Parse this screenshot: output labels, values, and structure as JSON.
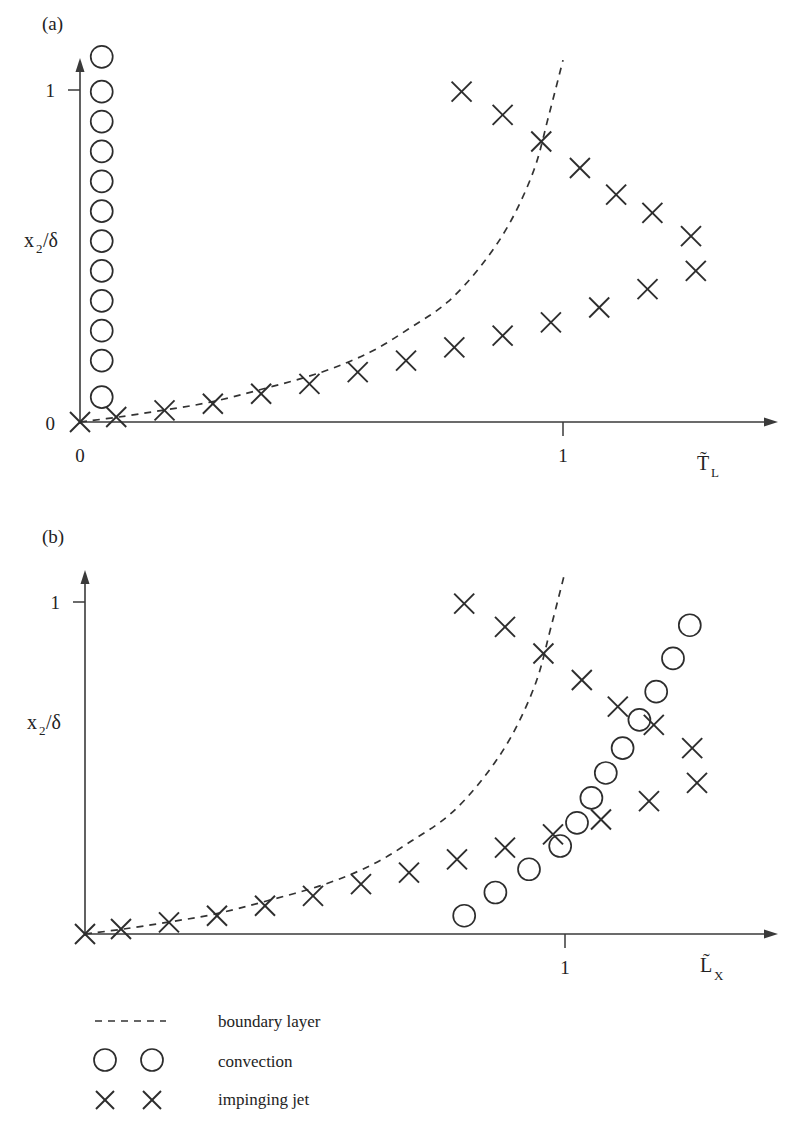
{
  "figure": {
    "background": "#ffffff",
    "ink_color": "#2d2d2d",
    "panels": [
      {
        "tag": "(a)",
        "tag_pos": [
          42,
          25
        ],
        "y_axis_label": "x_2/δ",
        "y_axis_label_parts": {
          "base": "x",
          "sub": "2",
          "tail": "/δ"
        },
        "x_axis_label_parts": {
          "base": "T̃",
          "sub": "L"
        },
        "x_axis_label": "T̃_L",
        "y_ticks": [
          {
            "value": "1",
            "px": 90
          },
          {
            "value": "0",
            "px": 422
          }
        ],
        "x_ticks": [
          {
            "value": "0",
            "px": 80
          },
          {
            "value": "1",
            "px": 563
          }
        ],
        "origin_px": [
          80,
          422
        ],
        "x_axis_end_px": 778,
        "y_axis_top_px": 60
      },
      {
        "tag": "(b)",
        "tag_pos": [
          42,
          538
        ],
        "y_axis_label": "x_2/δ",
        "y_axis_label_parts": {
          "base": "x",
          "sub": "2",
          "tail": "/δ"
        },
        "x_axis_label_parts": {
          "base": "L̃",
          "sub": "X"
        },
        "x_axis_label": "L̃_X",
        "y_ticks": [
          {
            "value": "1",
            "px": 602
          }
        ],
        "x_ticks": [
          {
            "value": "1",
            "px": 565
          }
        ],
        "origin_px": [
          85,
          934
        ],
        "x_axis_end_px": 778,
        "y_axis_top_px": 572
      }
    ]
  },
  "legend": {
    "entries": [
      {
        "symbol": "dashed-line",
        "label": "boundary layer"
      },
      {
        "symbol": "two-circles",
        "label": "convection"
      },
      {
        "symbol": "two-crosses",
        "label": "impinging jet"
      }
    ],
    "symbol_x": 95,
    "text_x": 218,
    "rows_y": [
      1021,
      1062,
      1100
    ]
  },
  "chart_data": [
    {
      "type": "scatter",
      "panel": "(a)",
      "title": "",
      "xlabel": "T̃_L",
      "ylabel": "x_2/δ",
      "xlim": [
        0,
        1.45
      ],
      "ylim": [
        0,
        1.12
      ],
      "grid": false,
      "legend_position": "below-figure",
      "series": [
        {
          "name": "boundary layer",
          "kind": "line",
          "style": "dashed",
          "x": [
            0.0,
            0.08,
            0.17,
            0.27,
            0.38,
            0.5,
            0.6,
            0.68,
            0.76,
            0.83,
            0.89,
            0.94,
            0.97,
            1.0
          ],
          "y": [
            0.0,
            0.015,
            0.035,
            0.06,
            0.1,
            0.15,
            0.21,
            0.28,
            0.36,
            0.47,
            0.6,
            0.76,
            0.92,
            1.09
          ]
        },
        {
          "name": "convection",
          "kind": "circles",
          "x": [
            0.045,
            0.045,
            0.045,
            0.045,
            0.045,
            0.045,
            0.045,
            0.045,
            0.045,
            0.045,
            0.045,
            0.045
          ],
          "y": [
            1.1,
            0.995,
            0.905,
            0.815,
            0.725,
            0.635,
            0.545,
            0.455,
            0.365,
            0.275,
            0.185,
            0.075
          ]
        },
        {
          "name": "impinging jet lower branch",
          "kind": "crosses",
          "x": [
            0.0,
            0.075,
            0.175,
            0.275,
            0.375,
            0.475,
            0.575,
            0.675,
            0.775,
            0.875,
            0.975,
            1.075,
            1.175,
            1.275
          ],
          "y": [
            0.0,
            0.015,
            0.035,
            0.055,
            0.085,
            0.115,
            0.15,
            0.185,
            0.225,
            0.26,
            0.3,
            0.345,
            0.4,
            0.455
          ]
        },
        {
          "name": "impinging jet upper branch",
          "kind": "crosses",
          "x": [
            0.79,
            0.875,
            0.955,
            1.035,
            1.11,
            1.185,
            1.265
          ],
          "y": [
            0.995,
            0.925,
            0.845,
            0.765,
            0.685,
            0.63,
            0.56
          ]
        }
      ]
    },
    {
      "type": "scatter",
      "panel": "(b)",
      "title": "",
      "xlabel": "L̃_X",
      "ylabel": "x_2/δ",
      "xlim": [
        0,
        1.45
      ],
      "ylim": [
        0,
        1.12
      ],
      "grid": false,
      "legend_position": "below-figure",
      "series": [
        {
          "name": "boundary layer",
          "kind": "line",
          "style": "dashed",
          "x": [
            0.0,
            0.08,
            0.17,
            0.27,
            0.38,
            0.5,
            0.6,
            0.68,
            0.76,
            0.83,
            0.89,
            0.94,
            0.97,
            1.0
          ],
          "y": [
            0.0,
            0.015,
            0.035,
            0.06,
            0.1,
            0.15,
            0.21,
            0.28,
            0.36,
            0.47,
            0.6,
            0.76,
            0.92,
            1.09
          ]
        },
        {
          "name": "convection",
          "kind": "circles",
          "x": [
            0.79,
            0.855,
            0.925,
            0.99,
            1.025,
            1.055,
            1.085,
            1.12,
            1.155,
            1.19,
            1.225,
            1.26
          ],
          "y": [
            0.055,
            0.125,
            0.195,
            0.265,
            0.335,
            0.41,
            0.485,
            0.56,
            0.645,
            0.73,
            0.83,
            0.93
          ]
        },
        {
          "name": "impinging jet lower branch",
          "kind": "crosses",
          "x": [
            0.0,
            0.075,
            0.175,
            0.275,
            0.375,
            0.475,
            0.575,
            0.675,
            0.775,
            0.875,
            0.975,
            1.075,
            1.175,
            1.275
          ],
          "y": [
            0.0,
            0.015,
            0.035,
            0.055,
            0.085,
            0.115,
            0.15,
            0.185,
            0.225,
            0.26,
            0.3,
            0.345,
            0.4,
            0.455
          ]
        },
        {
          "name": "impinging jet upper branch",
          "kind": "crosses",
          "x": [
            0.79,
            0.875,
            0.955,
            1.035,
            1.11,
            1.185,
            1.265
          ],
          "y": [
            0.995,
            0.925,
            0.845,
            0.765,
            0.685,
            0.63,
            0.56
          ]
        }
      ]
    }
  ]
}
